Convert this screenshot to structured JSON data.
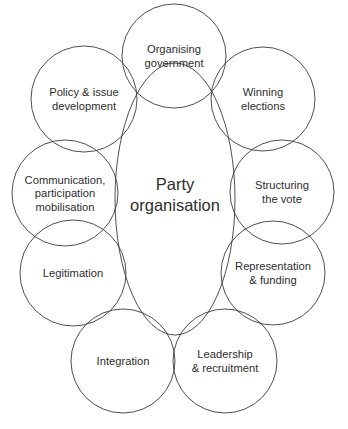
{
  "diagram": {
    "center": {
      "lines": [
        "Party",
        "organisation"
      ],
      "cx": 175,
      "cy": 199,
      "rx": 60,
      "ry": 136
    },
    "circles": [
      {
        "id": "organising-government",
        "lines": [
          "Organising",
          "government"
        ],
        "cx": 174,
        "cy": 56,
        "r": 52
      },
      {
        "id": "policy-issue-development",
        "lines": [
          "Policy & issue",
          "development"
        ],
        "cx": 84,
        "cy": 99,
        "r": 53
      },
      {
        "id": "winning-elections",
        "lines": [
          "Winning",
          "elections"
        ],
        "cx": 263,
        "cy": 99,
        "r": 52
      },
      {
        "id": "communication-participation-mobilisation",
        "lines": [
          "Communication,",
          "participation",
          "mobilisation"
        ],
        "cx": 65,
        "cy": 193,
        "r": 53
      },
      {
        "id": "structuring-the-vote",
        "lines": [
          "Structuring",
          "the vote"
        ],
        "cx": 282,
        "cy": 192,
        "r": 52
      },
      {
        "id": "legitimation",
        "lines": [
          "Legitimation"
        ],
        "cx": 73,
        "cy": 273,
        "r": 53
      },
      {
        "id": "representation-funding",
        "lines": [
          "Representation",
          "& funding"
        ],
        "cx": 273,
        "cy": 273,
        "r": 52
      },
      {
        "id": "integration",
        "lines": [
          "Integration"
        ],
        "cx": 123,
        "cy": 361,
        "r": 52
      },
      {
        "id": "leadership-recruitment",
        "lines": [
          "Leadership",
          "& recruitment"
        ],
        "cx": 225,
        "cy": 361,
        "r": 52
      }
    ],
    "colors": {
      "stroke": "#3a3a3a",
      "text": "#2e2e2e",
      "background": "#ffffff"
    }
  }
}
